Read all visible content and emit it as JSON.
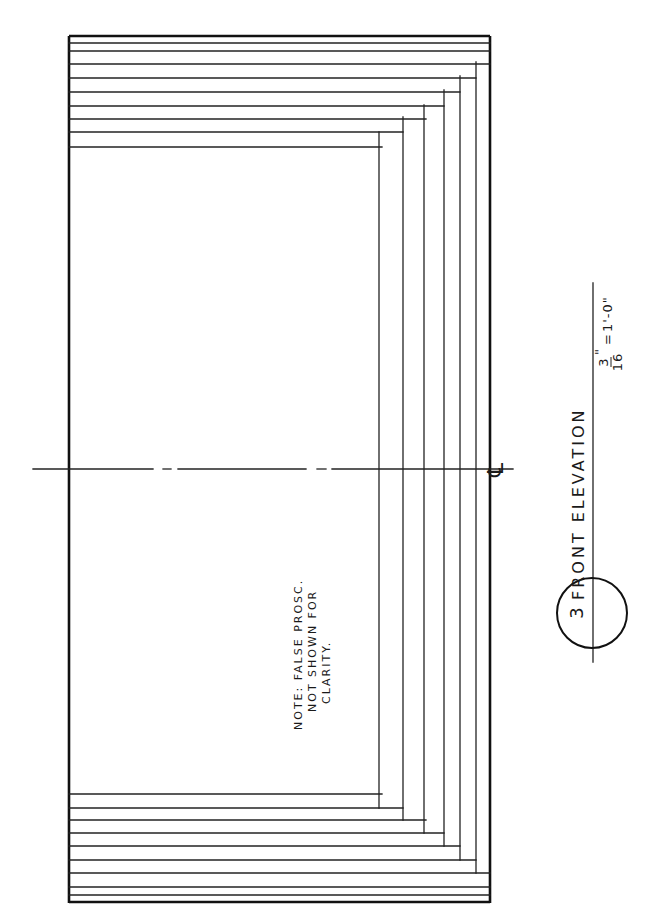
{
  "drawing": {
    "title": "FRONT ELEVATION",
    "scale": {
      "numerator": "3",
      "denominator": "16",
      "inch_mark": "\"",
      "equals": "=",
      "full": "1'-0\""
    },
    "detail_number": "3",
    "centerline_symbol": "℄",
    "note": {
      "line1": "NOTE: FALSE PROSC.",
      "line2": "NOT SHOWN FOR",
      "line3": "CLARITY."
    },
    "colors": {
      "ink": "#222222",
      "paper": "#ffffff"
    }
  }
}
